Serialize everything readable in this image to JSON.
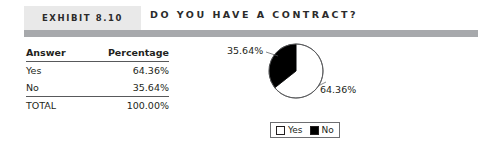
{
  "header": {
    "badge": "Exhibit 8.10",
    "title": "Do You Have a Contract?"
  },
  "table": {
    "columns": [
      "Answer",
      "Percentage"
    ],
    "rows": [
      {
        "answer": "Yes",
        "percentage": "64.36%"
      },
      {
        "answer": "No",
        "percentage": "35.64%"
      }
    ],
    "total": {
      "answer": "TOTAL",
      "percentage": "100.00%"
    }
  },
  "chart_data": {
    "type": "pie",
    "title": "Do You Have a Contract?",
    "categories": [
      "Yes",
      "No"
    ],
    "values": [
      64.36,
      35.64
    ],
    "labels": [
      "64.36%",
      "35.64%"
    ],
    "colors": [
      "#ffffff",
      "#000000"
    ],
    "legend": [
      "Yes",
      "No"
    ],
    "legend_position": "bottom",
    "start_angle_deg": 0,
    "direction": "counterclockwise",
    "units": "percent"
  },
  "legend": {
    "yes": "Yes",
    "no": "No"
  }
}
